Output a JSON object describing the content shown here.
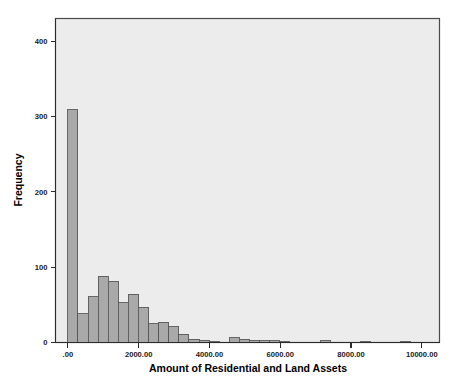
{
  "chart_data": {
    "type": "bar",
    "title": "",
    "subtitle": "",
    "xlabel": "Amount of Residential and Land Assets",
    "ylabel": "Frequency",
    "xlim": [
      -350,
      10500
    ],
    "ylim": [
      0,
      430
    ],
    "grid": false,
    "legend": null,
    "bin_width": 285,
    "x_ticks": [
      0,
      2000,
      4000,
      6000,
      8000,
      10000
    ],
    "x_tick_labels": [
      ".00",
      "2000.00",
      "4000.00",
      "6000.00",
      "8000.00",
      "10000.00"
    ],
    "y_ticks": [
      0,
      100,
      200,
      300,
      400
    ],
    "y_tick_labels": [
      "0",
      "100",
      "200",
      "300",
      "400"
    ],
    "bin_starts": [
      0,
      285,
      570,
      855,
      1140,
      1425,
      1710,
      1995,
      2280,
      2565,
      2850,
      3135,
      3420,
      3705,
      3990,
      4275,
      4560,
      4845,
      5130,
      5415,
      5700,
      5985,
      6270,
      6555,
      7125,
      7410,
      8265,
      9405
    ],
    "values": [
      309,
      38,
      61,
      88,
      81,
      53,
      64,
      47,
      25,
      27,
      21,
      11,
      4,
      3,
      1,
      0,
      6,
      4,
      2,
      2,
      2,
      1,
      0,
      0,
      2,
      0,
      1,
      1
    ],
    "bars": [
      {
        "x": 0,
        "value": 309
      },
      {
        "x": 285,
        "value": 38
      },
      {
        "x": 570,
        "value": 61
      },
      {
        "x": 855,
        "value": 88
      },
      {
        "x": 1140,
        "value": 81
      },
      {
        "x": 1425,
        "value": 53
      },
      {
        "x": 1710,
        "value": 64
      },
      {
        "x": 1995,
        "value": 47
      },
      {
        "x": 2280,
        "value": 25
      },
      {
        "x": 2565,
        "value": 27
      },
      {
        "x": 2850,
        "value": 21
      },
      {
        "x": 3135,
        "value": 11
      },
      {
        "x": 3420,
        "value": 4
      },
      {
        "x": 3705,
        "value": 3
      },
      {
        "x": 3990,
        "value": 1
      },
      {
        "x": 4560,
        "value": 6
      },
      {
        "x": 4845,
        "value": 4
      },
      {
        "x": 5130,
        "value": 2
      },
      {
        "x": 5415,
        "value": 2
      },
      {
        "x": 5700,
        "value": 2
      },
      {
        "x": 5985,
        "value": 1
      },
      {
        "x": 7125,
        "value": 2
      },
      {
        "x": 8265,
        "value": 1
      },
      {
        "x": 9405,
        "value": 1
      }
    ],
    "colors": {
      "bar_fill": "#a9a9a9",
      "bar_stroke": "#595959",
      "plot_background": "#ececec",
      "axis": "#2b2b2b",
      "page_background": "#ffffff"
    }
  },
  "axes": {
    "x_title": "Amount of Residential and Land Assets",
    "y_title": "Frequency"
  },
  "caption": {
    "text": ""
  }
}
